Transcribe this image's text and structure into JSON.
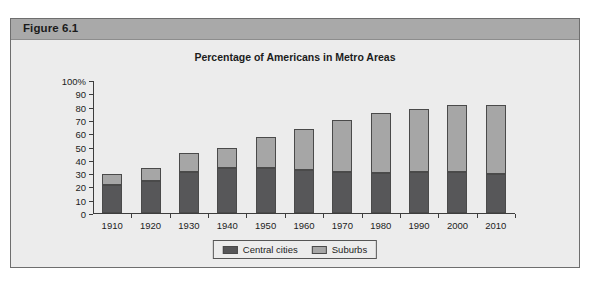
{
  "figure": {
    "band_label": "Figure 6.1"
  },
  "chart_data": {
    "type": "bar",
    "subtype": "stacked-vertical",
    "title": "Percentage of Americans in Metro Areas",
    "xlabel": "",
    "ylabel": "",
    "ylim": [
      0,
      100
    ],
    "yticks": [
      0,
      10,
      20,
      30,
      40,
      50,
      60,
      70,
      80,
      90,
      100
    ],
    "ytick_labels": [
      "0",
      "10",
      "20",
      "30",
      "40",
      "50",
      "60",
      "70",
      "80",
      "90",
      "100%"
    ],
    "grid": false,
    "legend_position": "bottom-center",
    "categories": [
      "1910",
      "1920",
      "1930",
      "1940",
      "1950",
      "1960",
      "1970",
      "1980",
      "1990",
      "2000",
      "2010"
    ],
    "series": [
      {
        "name": "Central cities",
        "color": "#575759",
        "values": [
          21,
          24,
          31,
          34,
          34,
          32,
          31,
          30,
          31,
          31,
          29
        ]
      },
      {
        "name": "Suburbs",
        "color": "#a6a6a6",
        "values": [
          8,
          10,
          14,
          15,
          23,
          31,
          39,
          45,
          47,
          50,
          52
        ]
      }
    ],
    "totals": [
      29,
      34,
      45,
      49,
      57,
      63,
      70,
      75,
      78,
      81,
      81
    ]
  },
  "legend": {
    "items": [
      {
        "label": "Central cities",
        "color": "#575759"
      },
      {
        "label": "Suburbs",
        "color": "#a6a6a6"
      }
    ]
  },
  "colors": {
    "band": "#a9a9a9",
    "panel": "#ececec",
    "frame": "#6e6e6e",
    "axis": "#3d3d3d",
    "central_cities": "#575759",
    "suburbs": "#a6a6a6"
  }
}
